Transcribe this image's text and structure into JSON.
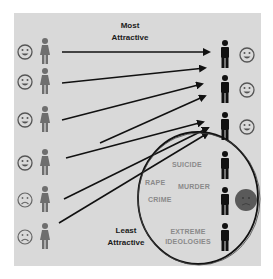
{
  "labels": {
    "top": "Most Attractive",
    "top_line1": "Most",
    "top_line2": "Attractive",
    "bottom_line1": "Least",
    "bottom_line2": "Attractive"
  },
  "circle_terms": {
    "suicide": "SUICIDE",
    "rape": "RAPE",
    "murder": "MURDER",
    "crime": "CRIME",
    "extreme_line1": "EXTREME",
    "extreme_line2": "IDEOLOGIES"
  },
  "left_column": [
    {
      "face": "happy-face-icon",
      "figure": "woman-icon"
    },
    {
      "face": "happy-face-icon",
      "figure": "woman-icon"
    },
    {
      "face": "happy-face-icon",
      "figure": "woman-icon"
    },
    {
      "face": "happy-face-icon",
      "figure": "woman-icon"
    },
    {
      "face": "sad-face-icon",
      "figure": "woman-icon"
    },
    {
      "face": "sad-face-icon",
      "figure": "woman-icon"
    }
  ],
  "right_column": [
    {
      "figure": "man-icon",
      "face": "happy-face-icon"
    },
    {
      "figure": "man-icon",
      "face": "happy-face-icon"
    },
    {
      "figure": "man-icon",
      "face": "happy-face-icon"
    },
    {
      "figure": "man-icon",
      "face": null
    },
    {
      "figure": "man-icon",
      "face": "angry-dark-face-icon"
    },
    {
      "figure": "man-icon",
      "face": null
    }
  ],
  "colors": {
    "panel": "#d9d9d9",
    "arrow": "#111111",
    "woman": "#6e6e6e",
    "man": "#111111",
    "dark_face": "#5a5a5a",
    "term_text": "#8a8a8a"
  }
}
